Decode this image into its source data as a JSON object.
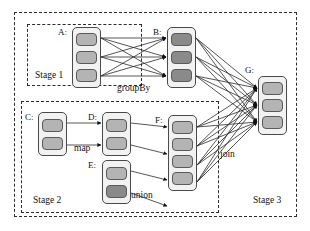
{
  "figure": {
    "type": "dag-diagram"
  },
  "frame": {
    "name": "outer-frame"
  },
  "stages": [
    {
      "id": "stage1",
      "label": "Stage 1",
      "x": 27,
      "y": 24,
      "w": 115,
      "h": 62,
      "label_x": 35,
      "label_y": 71
    },
    {
      "id": "stage2",
      "label": "Stage 2",
      "x": 21,
      "y": 101,
      "w": 198,
      "h": 112,
      "label_x": 33,
      "label_y": 196
    },
    {
      "id": "stage3",
      "label": "Stage 3",
      "x": 14,
      "y": 12,
      "w": 283,
      "h": 205,
      "label_x": 253,
      "label_y": 196
    }
  ],
  "rdds": [
    {
      "id": "A",
      "label": "A:",
      "x": 72,
      "y": 27,
      "w": 29,
      "h": 61,
      "label_x": 58,
      "label_y": 28,
      "partitions": [
        {
          "shade": "light"
        },
        {
          "shade": "light"
        },
        {
          "shade": "light"
        }
      ]
    },
    {
      "id": "B",
      "label": "B:",
      "x": 167,
      "y": 27,
      "w": 29,
      "h": 61,
      "label_x": 153,
      "label_y": 28,
      "partitions": [
        {
          "shade": "dark"
        },
        {
          "shade": "dark"
        },
        {
          "shade": "dark"
        }
      ]
    },
    {
      "id": "C",
      "label": "C:",
      "x": 38,
      "y": 112,
      "w": 29,
      "h": 44,
      "label_x": 25,
      "label_y": 113,
      "partitions": [
        {
          "shade": "light"
        },
        {
          "shade": "light"
        }
      ]
    },
    {
      "id": "D",
      "label": "D:",
      "x": 102,
      "y": 112,
      "w": 29,
      "h": 44,
      "label_x": 88,
      "label_y": 113,
      "partitions": [
        {
          "shade": "light"
        },
        {
          "shade": "light"
        }
      ]
    },
    {
      "id": "E",
      "label": "E:",
      "x": 102,
      "y": 160,
      "w": 29,
      "h": 44,
      "label_x": 88,
      "label_y": 161,
      "partitions": [
        {
          "shade": "light"
        },
        {
          "shade": "dark"
        }
      ]
    },
    {
      "id": "F",
      "label": "F:",
      "x": 168,
      "y": 115,
      "w": 29,
      "h": 76,
      "label_x": 155,
      "label_y": 116,
      "partitions": [
        {
          "shade": "light"
        },
        {
          "shade": "light"
        },
        {
          "shade": "light"
        },
        {
          "shade": "light"
        }
      ]
    },
    {
      "id": "G",
      "label": "G:",
      "x": 258,
      "y": 76,
      "w": 29,
      "h": 59,
      "label_x": 245,
      "label_y": 66,
      "partitions": [
        {
          "shade": "light"
        },
        {
          "shade": "light"
        },
        {
          "shade": "light"
        }
      ]
    }
  ],
  "operations": [
    {
      "id": "groupBy",
      "label": "groupBy",
      "x": 117,
      "y": 84,
      "dependency": "wide"
    },
    {
      "id": "map",
      "label": "map",
      "x": 74,
      "y": 144,
      "dependency": "narrow"
    },
    {
      "id": "union",
      "label": "union",
      "x": 131,
      "y": 191,
      "dependency": "narrow"
    },
    {
      "id": "join",
      "label": "join",
      "x": 220,
      "y": 150,
      "dependency": "wide"
    }
  ],
  "edges": [
    {
      "from": "A",
      "to": "B",
      "op": "groupBy",
      "kind": "all-to-all",
      "count": 9
    },
    {
      "from": "C",
      "to": "D",
      "op": "map",
      "kind": "one-to-one",
      "count": 2
    },
    {
      "from": "D",
      "to": "F",
      "op": "union",
      "kind": "one-to-one",
      "count": 2
    },
    {
      "from": "E",
      "to": "F",
      "op": "union",
      "kind": "one-to-one",
      "count": 2
    },
    {
      "from": "B",
      "to": "G",
      "op": "join",
      "kind": "all-to-all",
      "count": 9
    },
    {
      "from": "F",
      "to": "G",
      "op": "join",
      "kind": "all-to-all",
      "count": 12
    }
  ],
  "colors": {
    "stroke": "#2b2b2b",
    "partition_light": "#b4b4b4",
    "partition_dark": "#8a8a8a",
    "rdd_fill": "#f2f2f2",
    "text": "#111111"
  }
}
